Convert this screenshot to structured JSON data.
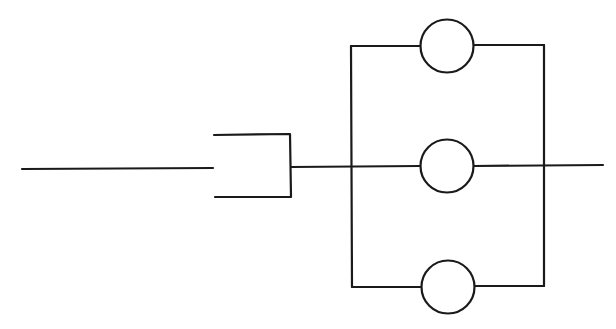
{
  "diagram": {
    "type": "circuit-schematic",
    "stroke_color": "#1a1a1a",
    "background": "#ffffff",
    "components": [
      {
        "id": "input-wire",
        "kind": "wire"
      },
      {
        "id": "bracket-connector",
        "kind": "connector"
      },
      {
        "id": "circle-top",
        "kind": "element",
        "branch": "top"
      },
      {
        "id": "circle-middle",
        "kind": "element",
        "branch": "middle"
      },
      {
        "id": "circle-bottom",
        "kind": "element",
        "branch": "bottom"
      },
      {
        "id": "output-wire",
        "kind": "wire"
      }
    ]
  }
}
